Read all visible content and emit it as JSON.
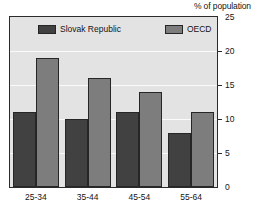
{
  "chart_data": {
    "type": "bar",
    "title": "",
    "axis_note": "% of population",
    "xlabel": "",
    "ylabel": "",
    "categories": [
      "25-34",
      "35-44",
      "45-54",
      "55-64"
    ],
    "series": [
      {
        "name": "Slovak Republic",
        "color": "#414141",
        "values": [
          11,
          10,
          11,
          8
        ]
      },
      {
        "name": "OECD",
        "color": "#7d7d7d",
        "values": [
          19,
          16,
          14,
          11
        ]
      }
    ],
    "ylim": [
      0,
      25
    ],
    "yticks": [
      0,
      5,
      10,
      15,
      20,
      25
    ],
    "ytick_labels": [
      "0",
      "5",
      "10",
      "15",
      "20",
      "25"
    ],
    "y_axis_position": "right",
    "grid": true,
    "grid_color": "#fafafa",
    "plot_background": "#e3e3e3",
    "frame_color": "#2b2b2b",
    "legend": {
      "position": "top-inside",
      "entries": [
        "Slovak Republic",
        "OECD"
      ]
    }
  }
}
